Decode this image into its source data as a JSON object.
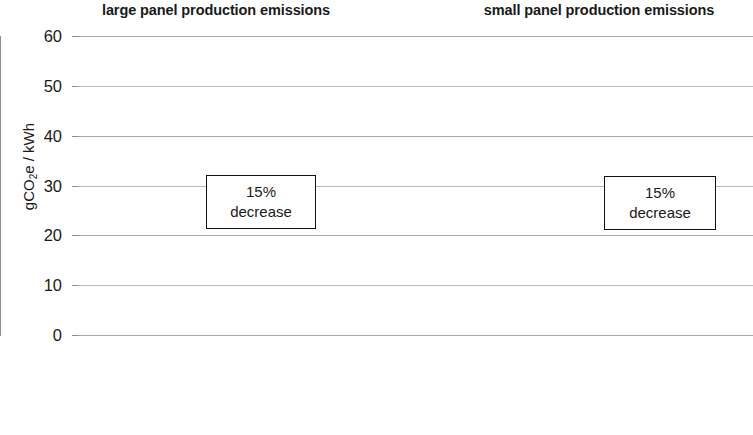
{
  "titles": {
    "left_panel": "large panel production emissions",
    "right_panel": "small panel production emissions"
  },
  "axis": {
    "y_title_main": "gCO",
    "y_title_sub": "2",
    "y_title_tail": "e / kWh",
    "y_title_full": "gCO2e / kWh"
  },
  "annotations": {
    "left": {
      "line1": "15%",
      "line2": "decrease"
    },
    "right": {
      "line1": "15%",
      "line2": "decrease"
    }
  },
  "colors": {
    "base_series": "#6f6fc4",
    "extra_series": "#f4744a",
    "gridline": "#a8a8a8",
    "axis": "#8e8e8e",
    "text": "#1a1a1a",
    "annotation_border": "#111111"
  },
  "chart_data": {
    "type": "bar",
    "title": "",
    "xlabel": "",
    "ylabel": "gCO2e / kWh",
    "ylim": [
      0,
      60
    ],
    "yticks": [
      0,
      10,
      20,
      30,
      40,
      50,
      60
    ],
    "ytick_labels": [
      "0",
      "10",
      "20",
      "30",
      "40",
      "50",
      "60"
    ],
    "grid": true,
    "legend": false,
    "stacked": true,
    "panels": [
      {
        "name": "large panel production emissions",
        "categories": [
          "fixed",
          "tracker added, not activated",
          "tracker added, activated"
        ],
        "category_lines": [
          [
            "fixed"
          ],
          [
            "tracker",
            "added,",
            "not",
            "activated"
          ],
          [
            "tracker",
            "added,",
            "activated"
          ]
        ],
        "series": [
          {
            "name": "panel production",
            "values": [
              50,
              50,
              42.5
            ]
          },
          {
            "name": "tracker addition",
            "values": [
              0,
              5,
              4.5
            ]
          }
        ],
        "totals": [
          50,
          55,
          47
        ],
        "annotation": "15% decrease"
      },
      {
        "name": "small panel production emissions",
        "categories": [
          "fixed",
          "tracker added, not activated",
          "tracker added, activated"
        ],
        "category_lines": [
          [
            "fixed"
          ],
          [
            "tracker",
            "added,",
            "not",
            "activated"
          ],
          [
            "tracker",
            "added,",
            "activated"
          ]
        ],
        "series": [
          {
            "name": "panel production",
            "values": [
              10,
              10,
              8.5
            ]
          },
          {
            "name": "tracker addition",
            "values": [
              0,
              5,
              4.5
            ]
          }
        ],
        "totals": [
          10,
          15,
          13
        ],
        "annotation": "15% decrease"
      }
    ]
  }
}
